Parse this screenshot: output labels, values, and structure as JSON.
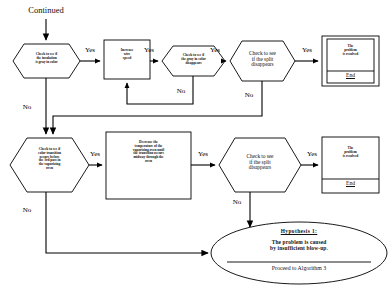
{
  "diagram": {
    "entry_label": "Continued",
    "stroke_color": "#000000",
    "fill_color": "#ffffff"
  },
  "nodes": {
    "check_insulation_gray": {
      "shape": "hexagon",
      "text": "Check to see if\nthe insulation\nis gray in color"
    },
    "increase_wire_speed": {
      "shape": "rectangle",
      "text": "Increase\nwire\nspeed"
    },
    "check_gray_disappears": {
      "shape": "hexagon",
      "text": "Check to see if\nthe gray in color\ndisappears"
    },
    "check_split_disappears_top": {
      "shape": "hexagon",
      "text": "Check to see\nif the split\ndisappears"
    },
    "problem_resolved_top": {
      "shape": "terminator",
      "text": "The\nproblem\nis resolved",
      "end_label": "End"
    },
    "check_color_transition": {
      "shape": "hexagon",
      "text": "Check to see if\ncolor transition\noccurs before\nthe 3rd pass in\nthe vaporizing\noven"
    },
    "decrease_temperature": {
      "shape": "rectangle",
      "text": "Decrease the\ntemperature of the\nvaporizing oven until\nthe transition occurs\nmidway through the\noven"
    },
    "check_split_disappears_bottom": {
      "shape": "hexagon",
      "text": "Check to see\nif the split\ndisappears"
    },
    "problem_resolved_bottom": {
      "shape": "terminator",
      "text": "The\nproblem\nis resolved",
      "end_label": "End"
    },
    "hypothesis_ellipse": {
      "shape": "ellipse",
      "title": "Hypothesis   1:",
      "body": "The problem is caused\nby insufficient blow-up.",
      "proceed": "Proceed to Algorithm 3"
    }
  },
  "edge_labels": {
    "yes_1": "Yes",
    "yes_2": "Yes",
    "yes_3": "Yes",
    "yes_4": "Yes",
    "yes_5": "Yes",
    "yes_6": "Yes",
    "no_1": "No",
    "no_2": "No",
    "no_3": "No",
    "no_4": "No"
  }
}
